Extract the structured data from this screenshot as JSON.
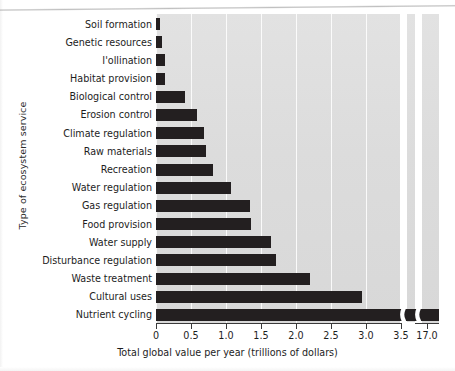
{
  "chart_data": {
    "type": "bar",
    "orientation": "horizontal",
    "title": "",
    "xlabel": "Total global value per year (trillions of dollars)",
    "ylabel": "Type of ecosystem service",
    "categories": [
      "Soil formation",
      "Genetic resources",
      "I'ollination",
      "Habitat provision",
      "Biological control",
      "Erosion control",
      "Climate regulation",
      "Raw materials",
      "Recreation",
      "Water regulation",
      "Gas regulation",
      "Food provision",
      "Water supply",
      "Disturbance regulation",
      "Waste treatment",
      "Cultural uses",
      "Nutrient cycling"
    ],
    "values": [
      0.05,
      0.09,
      0.13,
      0.13,
      0.42,
      0.58,
      0.68,
      0.72,
      0.81,
      1.07,
      1.34,
      1.36,
      1.64,
      1.71,
      2.2,
      2.94,
      17.0
    ],
    "xtick_labels": [
      "0",
      "0.5",
      "1.0",
      "1.5",
      "2.0",
      "2.5",
      "3.0",
      "3.5",
      "17.0"
    ],
    "xtick_values": [
      0,
      0.5,
      1.0,
      1.5,
      2.0,
      2.5,
      3.0,
      3.5,
      17.0
    ],
    "xlim": [
      0,
      3.5
    ],
    "axis_break": true,
    "axis_break_after": 3.5,
    "grid": "vertical-white",
    "bar_color": "#231f20",
    "plot_background": "#dedede",
    "legend": "none"
  }
}
